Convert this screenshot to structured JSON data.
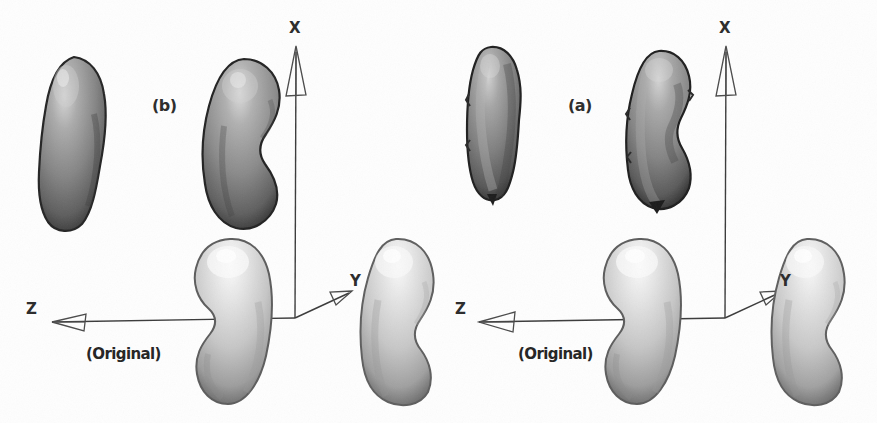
{
  "figure": {
    "width": 877,
    "height": 423,
    "background_color": "#fefefe",
    "type": "scientific-figure"
  },
  "panels": [
    {
      "id": "panel-b",
      "label": "(b)",
      "label_x": 152,
      "label_y": 106,
      "original_label": "(Original)",
      "original_label_x": 86,
      "original_label_y": 355,
      "axes": {
        "origin": {
          "x": 295,
          "y": 318
        },
        "x_axis": {
          "label": "X",
          "label_x": 289,
          "label_y": 28,
          "tip_x": 295,
          "tip_y": 45
        },
        "y_axis": {
          "label": "Y",
          "label_x": 352,
          "label_y": 281,
          "tip_x": 348,
          "tip_y": 292
        },
        "z_axis": {
          "label": "Z",
          "label_x": 30,
          "label_y": 310,
          "tip_x": 48,
          "tip_y": 322
        },
        "stroke_color": "#3a3a3a"
      },
      "shapes": [
        {
          "name": "dark-shape-top-left",
          "tone": "dark",
          "fill": "#8a8a8a",
          "x": 34,
          "y": 58,
          "w": 72,
          "h": 170,
          "variant": "smooth-bean-left"
        },
        {
          "name": "dark-shape-top-right",
          "tone": "dark",
          "fill": "#8e8e8e",
          "x": 200,
          "y": 60,
          "w": 82,
          "h": 168,
          "variant": "smooth-bean-notch"
        },
        {
          "name": "light-shape-bottom-center",
          "tone": "light",
          "fill": "#c9c9c9",
          "x": 188,
          "y": 240,
          "w": 88,
          "h": 165,
          "variant": "smooth-bean-notch-left"
        },
        {
          "name": "light-shape-bottom-right",
          "tone": "light",
          "fill": "#cccccc",
          "x": 358,
          "y": 240,
          "w": 78,
          "h": 163,
          "variant": "smooth-bean-notch-right"
        }
      ]
    },
    {
      "id": "panel-a",
      "label": "(a)",
      "label_x": 568,
      "label_y": 106,
      "original_label": "(Original)",
      "original_label_x": 518,
      "original_label_y": 355,
      "axes": {
        "origin": {
          "x": 725,
          "y": 318
        },
        "x_axis": {
          "label": "X",
          "label_x": 719,
          "label_y": 28,
          "tip_x": 725,
          "tip_y": 45
        },
        "y_axis": {
          "label": "Y",
          "label_x": 782,
          "label_y": 281,
          "tip_x": 778,
          "tip_y": 292
        },
        "z_axis": {
          "label": "Z",
          "label_x": 460,
          "label_y": 310,
          "tip_x": 478,
          "tip_y": 322
        },
        "stroke_color": "#3a3a3a"
      },
      "shapes": [
        {
          "name": "dark-shape-top-left",
          "tone": "dark",
          "fill": "#838383",
          "x": 22,
          "y": 48,
          "w": 62,
          "h": 152,
          "variant": "rough-bean-left"
        },
        {
          "name": "dark-shape-top-right",
          "tone": "dark",
          "fill": "#888888",
          "x": 185,
          "y": 54,
          "w": 70,
          "h": 158,
          "variant": "rough-bean-notch"
        },
        {
          "name": "light-shape-bottom-center",
          "tone": "light",
          "fill": "#c9c9c9",
          "x": 158,
          "y": 240,
          "w": 88,
          "h": 165,
          "variant": "smooth-bean-notch-left"
        },
        {
          "name": "light-shape-bottom-right",
          "tone": "light",
          "fill": "#cbcbcb",
          "x": 328,
          "y": 240,
          "w": 80,
          "h": 163,
          "variant": "smooth-bean-notch-right"
        }
      ]
    }
  ],
  "colors": {
    "dark_shape": "#8a8a8a",
    "dark_shape_shadow": "#2e2e2e",
    "dark_shape_highlight": "#d2d2d2",
    "light_shape": "#cacaca",
    "light_shape_shadow": "#6f6f6f",
    "light_shape_highlight": "#f2f2f2",
    "axis_line": "#3a3a3a",
    "text": "#232323",
    "background": "#fefefe"
  }
}
